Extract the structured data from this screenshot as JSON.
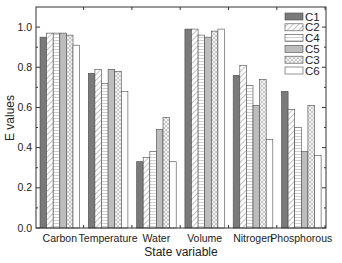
{
  "chart_data": {
    "type": "bar",
    "title": "",
    "xlabel": "State variable",
    "ylabel": "E values",
    "ylim": [
      0.0,
      1.1
    ],
    "yticks": [
      0.0,
      0.2,
      0.4,
      0.6,
      0.8,
      1.0
    ],
    "ytick_labels": [
      "0.0",
      "0.2",
      "0.4",
      "0.6",
      "0.8",
      "1.0"
    ],
    "grid": false,
    "legend_position": "upper right",
    "categories": [
      "Carbon",
      "Temperature",
      "Water",
      "Volume",
      "Nitrogen",
      "Phosphorous"
    ],
    "series": [
      {
        "name": "C1",
        "pattern": "solid-dark",
        "color": "#7a7a7a",
        "values": [
          0.95,
          0.77,
          0.33,
          0.99,
          0.76,
          0.68
        ]
      },
      {
        "name": "C2",
        "pattern": "diagonal-hatch",
        "color": "#d8d8d8",
        "values": [
          0.97,
          0.79,
          0.35,
          0.99,
          0.81,
          0.59
        ]
      },
      {
        "name": "C4",
        "pattern": "horizontal-lines",
        "color": "#e6e6e6",
        "values": [
          0.97,
          0.72,
          0.38,
          0.96,
          0.71,
          0.5
        ]
      },
      {
        "name": "C5",
        "pattern": "solid-light",
        "color": "#bdbdbd",
        "values": [
          0.97,
          0.79,
          0.49,
          0.95,
          0.61,
          0.38
        ]
      },
      {
        "name": "C3",
        "pattern": "crosshatch-dots",
        "color": "#dcdcdc",
        "values": [
          0.96,
          0.78,
          0.55,
          0.98,
          0.74,
          0.61
        ]
      },
      {
        "name": "C6",
        "pattern": "empty",
        "color": "#ffffff",
        "values": [
          0.91,
          0.68,
          0.33,
          0.99,
          0.44,
          0.36
        ]
      }
    ]
  }
}
